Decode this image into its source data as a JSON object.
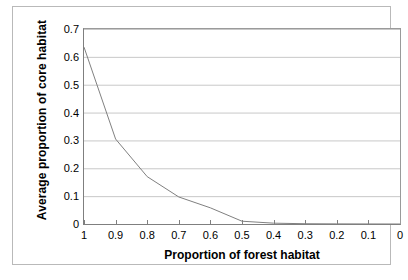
{
  "chart_data": {
    "type": "line",
    "title": "",
    "xlabel": "Proportion of forest habitat",
    "ylabel": "Average proportion of core habitat",
    "xlim": [
      1,
      0
    ],
    "ylim": [
      0,
      0.7
    ],
    "x_reversed": true,
    "grid": "horizontal",
    "legend": "none",
    "line_color": "#808080",
    "x": [
      1,
      0.9,
      0.8,
      0.7,
      0.6,
      0.5,
      0.4,
      0.3,
      0.2,
      0.1,
      0
    ],
    "xtick_labels": [
      "1",
      "0.9",
      "0.8",
      "0.7",
      "0.6",
      "0.5",
      "0.4",
      "0.3",
      "0.2",
      "0.1",
      "0"
    ],
    "ytick_values": [
      0.7,
      0.6,
      0.5,
      0.4,
      0.3,
      0.2,
      0.1,
      0
    ],
    "ytick_labels": [
      "0.7",
      "0.6",
      "0.5",
      "0.4",
      "0.3",
      "0.2",
      "0.1",
      "0"
    ],
    "series": [
      {
        "name": "Average proportion of core habitat",
        "values": [
          0.635,
          0.305,
          0.17,
          0.097,
          0.058,
          0.01,
          0.003,
          0.001,
          0.0005,
          0.0002,
          0
        ]
      }
    ]
  },
  "colors": {
    "line": "#808080",
    "gridline": "#c8c8c8",
    "axis": "#7f7f7f",
    "frame": "#b9b9b9",
    "background": "#ffffff",
    "text": "#000000"
  }
}
